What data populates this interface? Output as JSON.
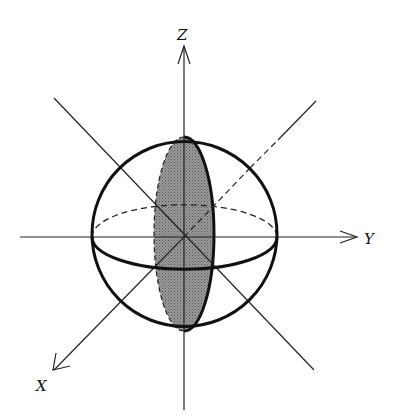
{
  "diagram": {
    "type": "3d-sphere-axes",
    "axes": [
      {
        "name": "Z",
        "label": "Z",
        "direction": "up"
      },
      {
        "name": "Y",
        "label": "Y",
        "direction": "right"
      },
      {
        "name": "X",
        "label": "X",
        "direction": "down-left"
      }
    ],
    "colors": {
      "stroke": "#111111",
      "shaded_section": "#8a8a8a",
      "background": "#ffffff"
    }
  }
}
